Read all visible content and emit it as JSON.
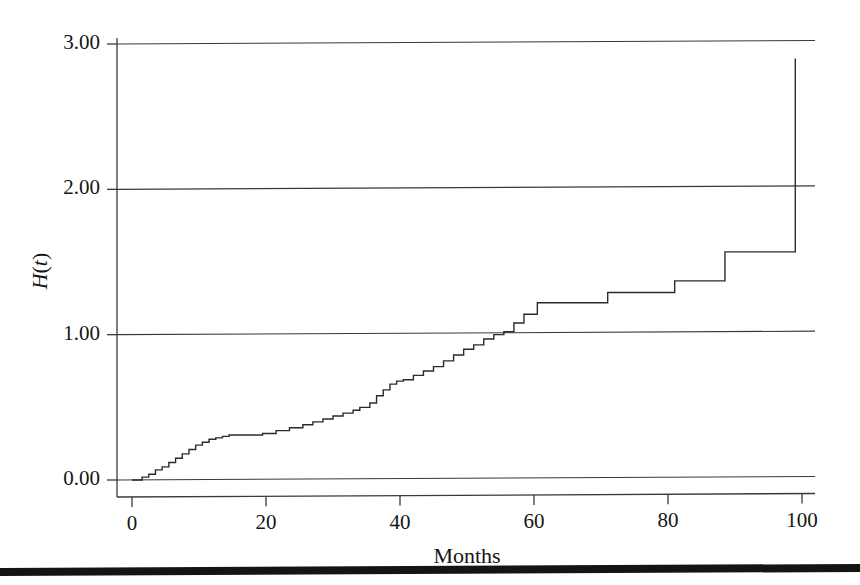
{
  "figure": {
    "background_color": "#ffffff",
    "line_color": "#2b2b2b",
    "axis_color": "#3a3a3a",
    "text_color": "#151515"
  },
  "page_artifact": {
    "name": "scan-edge-bar",
    "color": "#141414",
    "top_px": 566,
    "height_px": 8
  },
  "axes": {
    "x_axis_title": "Months",
    "y_axis_title": "H(t)",
    "y_axis_title_parts": {
      "function": "H",
      "open": "(",
      "variable": "t",
      "close": ")"
    },
    "x_tick_labels": [
      "0",
      "20",
      "40",
      "60",
      "80",
      "100"
    ],
    "y_tick_labels": [
      "0.00",
      "1.00",
      "2.00",
      "3.00"
    ]
  },
  "chart_data": {
    "type": "line",
    "title": "",
    "subtitle": "",
    "xlabel": "Months",
    "ylabel": "H(t)",
    "xlim": [
      0,
      103
    ],
    "ylim": [
      0.0,
      3.05
    ],
    "xticks": [
      0,
      20,
      40,
      60,
      80,
      100
    ],
    "yticks": [
      0.0,
      1.0,
      2.0,
      3.0
    ],
    "grid": "horizontal-gridlines-at-yticks",
    "legend": "none",
    "annotations": [],
    "series": [
      {
        "name": "Cumulative hazard H(t)",
        "style": "step-post",
        "description": "Nelson-Aalen cumulative hazard step function rising from 0 at t=0 to about 2.9 by t=99",
        "x": [
          0,
          1.5,
          2.5,
          3.5,
          4.5,
          5.5,
          6.5,
          7.5,
          8.5,
          9.5,
          10.5,
          11.5,
          12.5,
          13.5,
          14.5,
          19.5,
          21.5,
          23.5,
          25.5,
          27.0,
          28.5,
          30.0,
          31.5,
          33.0,
          34.0,
          35.5,
          36.5,
          37.5,
          38.5,
          39.5,
          40.5,
          42.0,
          43.5,
          45.0,
          46.5,
          48.0,
          49.5,
          51.0,
          52.5,
          54.0,
          55.5,
          57.0,
          58.5,
          60.5,
          71.0,
          81.0,
          88.5,
          99.0,
          99.0
        ],
        "y": [
          0.0,
          0.02,
          0.04,
          0.07,
          0.09,
          0.12,
          0.15,
          0.18,
          0.21,
          0.24,
          0.26,
          0.28,
          0.29,
          0.3,
          0.31,
          0.32,
          0.34,
          0.36,
          0.38,
          0.4,
          0.42,
          0.44,
          0.46,
          0.48,
          0.5,
          0.53,
          0.58,
          0.62,
          0.66,
          0.68,
          0.69,
          0.72,
          0.75,
          0.78,
          0.82,
          0.86,
          0.9,
          0.93,
          0.97,
          1.0,
          1.02,
          1.08,
          1.14,
          1.22,
          1.29,
          1.37,
          1.57,
          1.91,
          2.9
        ]
      }
    ]
  },
  "plot_geometry": {
    "left_px": 117,
    "right_px": 815,
    "top_px": 44,
    "bottom_px": 497,
    "x0_px": 132,
    "x100_px": 802,
    "y0_px": 480,
    "y3_px": 44
  }
}
